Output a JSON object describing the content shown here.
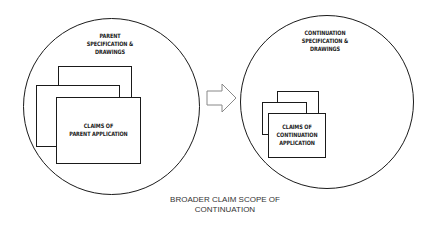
{
  "diagram": {
    "left": {
      "title": "PARENT\nSPECIFICATION &\nDRAWINGS",
      "claims": "CLAIMS OF\nPARENT APPLICATION"
    },
    "right": {
      "title": "CONTINUATION\nSPECIFICATION &\nDRAWINGS",
      "claims": "CLAIMS OF\nCONTINUATION\nAPPLICATION"
    },
    "arrow": "right-arrow-icon",
    "caption": "BROADER  CLAIM SCOPE OF\nCONTINUATION",
    "colors": {
      "stroke": "#1a1a1a",
      "arrow": "#888888",
      "background": "#ffffff"
    }
  }
}
